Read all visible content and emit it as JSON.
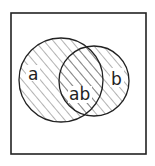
{
  "diagram": {
    "type": "venn",
    "universe_box": true,
    "sets": [
      {
        "name": "a",
        "label": "a",
        "shaded": true
      },
      {
        "name": "b",
        "label": "b",
        "shaded": true
      }
    ],
    "intersection_label": "ab",
    "colors": {
      "stroke": "#222222",
      "hatch": "#555555",
      "background": "#ffffff"
    }
  }
}
